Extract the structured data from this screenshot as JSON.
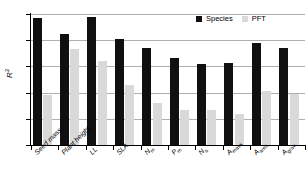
{
  "chart_data": {
    "type": "bar",
    "title": "",
    "subtitle": "",
    "xlabel": "",
    "ylabel": "R2",
    "ylabel_display": "R",
    "ylabel_superscript": "2",
    "ylim": [
      0,
      1
    ],
    "yticks": [
      0,
      0.2,
      0.4,
      0.6,
      0.8,
      1
    ],
    "ytick_labels": [
      "0",
      "0.2",
      "0.4",
      "0.6",
      "0.8",
      "1"
    ],
    "grid": "horizontal",
    "legend_position": "top-right-inside",
    "categories": [
      "Seed mass",
      "Plant height",
      "LL",
      "SLA",
      "Nm",
      "Pm",
      "Na",
      "Amass",
      "Aarea",
      "Agrav"
    ],
    "category_labels": [
      {
        "base": "Seed mass",
        "sub": ""
      },
      {
        "base": "Plant height",
        "sub": ""
      },
      {
        "base": "LL",
        "sub": ""
      },
      {
        "base": "SLA",
        "sub": ""
      },
      {
        "base": "N",
        "sub": "m"
      },
      {
        "base": "P",
        "sub": "m"
      },
      {
        "base": "N",
        "sub": "a"
      },
      {
        "base": "A",
        "sub": "mass"
      },
      {
        "base": "A",
        "sub": "area"
      },
      {
        "base": "A",
        "sub": "grav"
      }
    ],
    "series": [
      {
        "name": "Species",
        "color": "#101010",
        "values": [
          0.97,
          0.85,
          0.98,
          0.81,
          0.74,
          0.665,
          0.615,
          0.625,
          0.775,
          0.74
        ]
      },
      {
        "name": "PFT",
        "color": "#d9d9d9",
        "values": [
          0.38,
          0.735,
          0.64,
          0.455,
          0.32,
          0.27,
          0.27,
          0.24,
          0.41,
          0.39
        ]
      }
    ]
  },
  "legend": {
    "entries": [
      {
        "label": "Species",
        "color": "#101010"
      },
      {
        "label": "PFT",
        "color": "#d9d9d9"
      }
    ]
  },
  "colors": {
    "species": "#101010",
    "pft": "#d9d9d9",
    "axis": "#000000",
    "grid": "#b0b0b0",
    "background": "#ffffff"
  }
}
